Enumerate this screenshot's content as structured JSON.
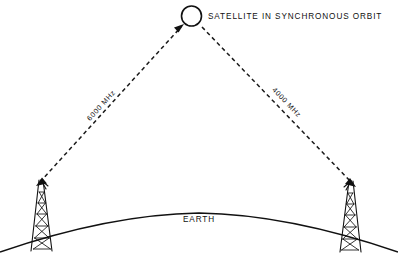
{
  "diagram": {
    "title_label": "SATELLITE IN SYNCHRONOUS ORBIT",
    "earth_label": "EARTH",
    "uplink": {
      "label": "6000 MHz",
      "direction": "up-to-satellite",
      "station": "left-ground-station"
    },
    "downlink": {
      "label": "4000 MHz",
      "direction": "down-to-station",
      "station": "right-ground-station"
    },
    "colors": {
      "ink": "#111111",
      "background": "#ffffff"
    },
    "elements": {
      "satellite_icon": "satellite-circle-icon",
      "left_tower_icon": "lattice-tower-icon",
      "right_tower_icon": "lattice-tower-icon",
      "earth_icon": "earth-curvature-arc"
    }
  }
}
